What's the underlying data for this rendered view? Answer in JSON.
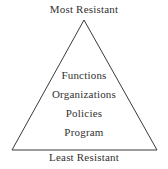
{
  "diagram": {
    "type": "triangle-pyramid",
    "title_top": "Most Resistant",
    "title_bottom": "Least Resistant",
    "colors": {
      "background": "#ffffff",
      "outline": "#3a3a3a",
      "text": "#333130"
    },
    "geometry": {
      "apex_x": 84,
      "apex_y": 20,
      "base_left_x": 12,
      "base_right_x": 157,
      "base_y": 150,
      "stroke_width": 1
    },
    "tiers": [
      {
        "label": "Functions"
      },
      {
        "label": "Organizations"
      },
      {
        "label": "Policies"
      },
      {
        "label": "Program"
      }
    ]
  }
}
